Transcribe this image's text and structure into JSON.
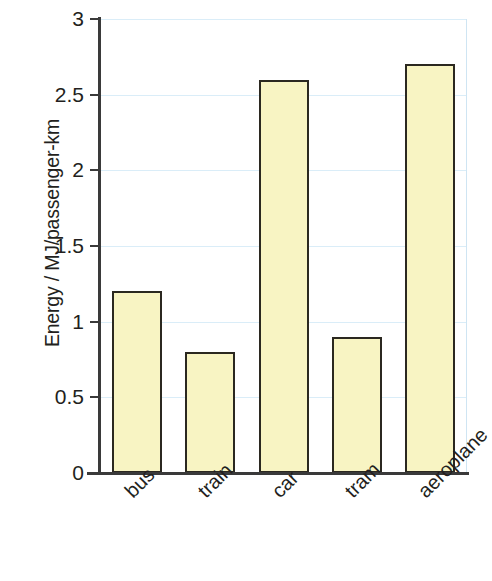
{
  "chart_data": {
    "type": "bar",
    "title": "",
    "subtitle": "",
    "xlabel": "",
    "ylabel": "Energy / MJ/passenger-km",
    "categories": [
      "bus",
      "train",
      "car",
      "tram",
      "aeroplane"
    ],
    "values": [
      1.2,
      0.8,
      2.6,
      0.9,
      2.7
    ],
    "series": [
      {
        "name": "Energy",
        "values": [
          1.2,
          0.8,
          2.6,
          0.9,
          2.7
        ]
      }
    ],
    "ylim": [
      0,
      3
    ],
    "ytick_labels": [
      "3",
      "2.5",
      "2",
      "1.5",
      "1",
      "0.5",
      "0"
    ],
    "ytick_values": [
      3,
      2.5,
      2,
      1.5,
      1,
      0.5,
      0
    ],
    "grid": true,
    "grid_axis": "y",
    "legend": false,
    "legend_position": "none",
    "annotations": [],
    "x_label_rotation": -45,
    "colors": {
      "bar_fill": "#f8f4c3",
      "bar_border": "#2b2820",
      "gridline": "#daedf8",
      "axis": "#3a3a3a",
      "text": "#231f20",
      "background": "#ffffff"
    }
  }
}
